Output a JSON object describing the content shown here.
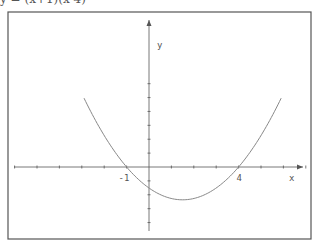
{
  "caption": "y = (x+1)(x-4)",
  "diagram": {
    "type": "function-graph",
    "frame": {
      "x": 8,
      "y": 12,
      "width": 303,
      "height": 227,
      "stroke": "#555555"
    },
    "axes": {
      "origin_px": {
        "x": 149,
        "y": 167
      },
      "unit_px": 22.4,
      "x_label": "x",
      "y_label": "y",
      "x_ticks": [
        -6,
        -5,
        -4,
        -3,
        -2,
        -1,
        1,
        2,
        3,
        4,
        5,
        6,
        7
      ],
      "y_ticks": [
        -4,
        -3,
        -2,
        -1,
        1,
        2,
        3,
        4,
        5,
        6
      ],
      "axis_color": "#555555"
    },
    "curve": {
      "equation": "y = (x+1)(x-4)",
      "x_range": [
        -2.9,
        5.9
      ],
      "vertical_scale_px": 5.25,
      "color": "#888888"
    },
    "labels": [
      {
        "text": "-1",
        "x_value": -1
      },
      {
        "text": "4",
        "x_value": 4
      }
    ]
  }
}
